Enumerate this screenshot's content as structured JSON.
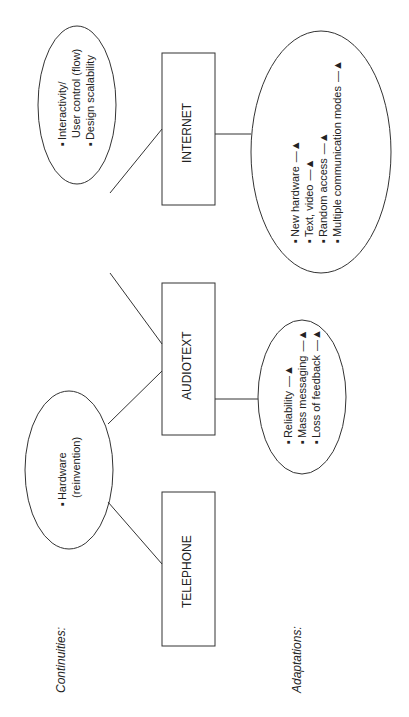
{
  "section_labels": {
    "continuities": "Continuities:",
    "adaptations": "Adaptations:"
  },
  "nodes": [
    {
      "id": "telephone",
      "label": "TELEPHONE"
    },
    {
      "id": "audiotext",
      "label": "AUDIOTEXT"
    },
    {
      "id": "internet",
      "label": "INTERNET"
    }
  ],
  "continuities": [
    {
      "between": "telephone-audiotext",
      "items": [
        "Hardware",
        "(reinvention)"
      ]
    },
    {
      "between": "audiotext-internet",
      "items": [
        "Interactivity/",
        "User control (flow)",
        "Design scalability"
      ]
    }
  ],
  "adaptations": {
    "audiotext": [
      {
        "text": "Reliability",
        "arrow": "up"
      },
      {
        "text": "Mass messaging",
        "arrow": "up"
      },
      {
        "text": "Loss of feedback",
        "arrow": "up"
      }
    ],
    "internet": [
      {
        "text": "New hardware",
        "arrow": "up"
      },
      {
        "text": "Text, video",
        "arrow": "up"
      },
      {
        "text": "Random access",
        "arrow": "up"
      },
      {
        "text": "Multiple communication modes",
        "arrow": "up"
      }
    ]
  },
  "symbols": {
    "arrow_up": "—▲"
  }
}
